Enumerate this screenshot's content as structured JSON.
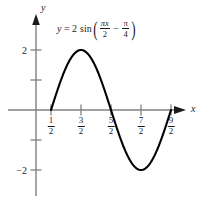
{
  "figure": {
    "title": "",
    "equation": {
      "lhs": "y",
      "equals": "=",
      "amplitude": "2",
      "function": "sin",
      "open_paren": "(",
      "arg_first_num": "πx",
      "arg_first_den": "2",
      "minus": "−",
      "arg_second_num": "π",
      "arg_second_den": "4",
      "close_paren": ")",
      "plain": "y = 2 sin(πx/2 − π/4)"
    },
    "axis_labels": {
      "x": "x",
      "y": "y"
    },
    "colors": {
      "curve": "#000000",
      "axis": "#808080",
      "text": "#1a1a1a",
      "background": "#ffffff"
    }
  },
  "x_ticks": [
    {
      "value": 0.5,
      "num": "1",
      "den": "2"
    },
    {
      "value": 1.5,
      "num": "3",
      "den": "2"
    },
    {
      "value": 2.5,
      "num": "5",
      "den": "2"
    },
    {
      "value": 3.5,
      "num": "7",
      "den": "2"
    },
    {
      "value": 4.5,
      "num": "9",
      "den": "2"
    }
  ],
  "y_ticks": [
    {
      "value": 2,
      "label": "2"
    },
    {
      "value": 1,
      "label": ""
    },
    {
      "value": -1,
      "label": ""
    },
    {
      "value": -2,
      "label": "−2"
    }
  ],
  "chart_data": {
    "type": "line",
    "title": "",
    "subtitle": "",
    "xlabel": "x",
    "ylabel": "y",
    "equation": "y = 2 sin(πx/2 − π/4)",
    "amplitude": 2,
    "period": 4,
    "phase_shift": 0.5,
    "xlim": [
      -0.4,
      5.2
    ],
    "ylim": [
      -2.6,
      2.6
    ],
    "grid": false,
    "legend": null,
    "xtick_labels": [
      "1/2",
      "3/2",
      "5/2",
      "7/2",
      "9/2"
    ],
    "xtick_values": [
      0.5,
      1.5,
      2.5,
      3.5,
      4.5
    ],
    "ytick_labels": [
      "2",
      "",
      "",
      "−2"
    ],
    "ytick_values": [
      2,
      1,
      -1,
      -2
    ],
    "key_points": [
      {
        "x": 0.5,
        "y": 0,
        "kind": "zero-ascending"
      },
      {
        "x": 1.5,
        "y": 2,
        "kind": "maximum"
      },
      {
        "x": 2.5,
        "y": 0,
        "kind": "zero-descending"
      },
      {
        "x": 3.5,
        "y": -2,
        "kind": "minimum"
      },
      {
        "x": 4.5,
        "y": 0,
        "kind": "zero-ascending"
      }
    ],
    "domain_drawn": [
      0.5,
      4.5
    ],
    "series": [
      {
        "name": "y = 2 sin(πx/2 − π/4)",
        "x": [
          0.5,
          0.75,
          1.0,
          1.25,
          1.5,
          1.75,
          2.0,
          2.25,
          2.5,
          2.75,
          3.0,
          3.25,
          3.5,
          3.75,
          4.0,
          4.25,
          4.5
        ],
        "values": [
          0,
          0.765,
          1.414,
          1.848,
          2,
          1.848,
          1.414,
          0.765,
          0,
          -0.765,
          -1.414,
          -1.848,
          -2,
          -1.848,
          -1.414,
          -0.765,
          0
        ]
      }
    ]
  }
}
